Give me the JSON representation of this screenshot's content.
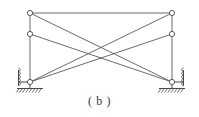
{
  "figure": {
    "caption": "( b )",
    "label": "b",
    "type": "structural-truss-diagram",
    "canvas": {
      "width": 199,
      "height": 117
    },
    "style": {
      "member_color": "#5a5a5a",
      "member_width": 0.9,
      "node_stroke": "#4a4a4a",
      "node_fill": "#ffffff",
      "node_radius": 2.6,
      "support_color": "#4a4a4a",
      "caption_color": "#3a3a3a",
      "background": "#ffffff"
    }
  },
  "chart_data": {
    "type": "diagram",
    "title": "( b )",
    "xlabel": "",
    "ylabel": "",
    "nodes": [
      {
        "id": "TL",
        "name": "top-left-node",
        "x": 30,
        "y": 13
      },
      {
        "id": "TR",
        "name": "top-right-node",
        "x": 172,
        "y": 13
      },
      {
        "id": "ML",
        "name": "mid-left-node",
        "x": 30,
        "y": 34
      },
      {
        "id": "MR",
        "name": "mid-right-node",
        "x": 172,
        "y": 34
      },
      {
        "id": "BL",
        "name": "bottom-left-node",
        "x": 30,
        "y": 82
      },
      {
        "id": "BR",
        "name": "bottom-right-node",
        "x": 172,
        "y": 82
      }
    ],
    "members": [
      {
        "id": "M1",
        "name": "top-chord",
        "from": "TL",
        "to": "TR"
      },
      {
        "id": "M2",
        "name": "left-column",
        "from": "TL",
        "to": "BL"
      },
      {
        "id": "M3",
        "name": "right-column",
        "from": "TR",
        "to": "BR"
      },
      {
        "id": "M4",
        "name": "diagonal-tl-br",
        "from": "TL",
        "to": "BR"
      },
      {
        "id": "M5",
        "name": "diagonal-tr-bl",
        "from": "TR",
        "to": "BL"
      },
      {
        "id": "M6",
        "name": "diagonal-ml-br",
        "from": "ML",
        "to": "BR"
      },
      {
        "id": "M7",
        "name": "diagonal-mr-bl",
        "from": "MR",
        "to": "BL"
      }
    ],
    "supports": [
      {
        "id": "SL",
        "name": "left-support",
        "at": "BL",
        "x": 30,
        "y": 82,
        "side": "left",
        "kind": "hatched-ground-with-spring"
      },
      {
        "id": "SR",
        "name": "right-support",
        "at": "BR",
        "x": 172,
        "y": 82,
        "side": "right",
        "kind": "hatched-ground-with-spring"
      }
    ],
    "annotations": []
  }
}
